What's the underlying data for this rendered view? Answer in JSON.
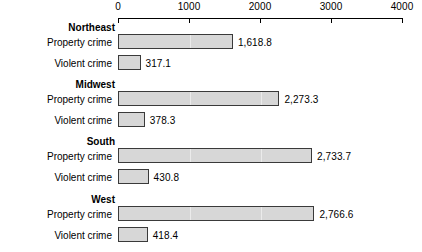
{
  "chart_data": {
    "type": "bar",
    "orientation": "horizontal",
    "title": "",
    "xlabel": "",
    "ylabel": "",
    "xlim": [
      0,
      4000
    ],
    "xticks": [
      0,
      1000,
      2000,
      3000,
      4000
    ],
    "xtick_labels": [
      "0",
      "1000",
      "2000",
      "3000",
      "4000"
    ],
    "grid": true,
    "legend": "none",
    "categories": [
      "Northeast",
      "Midwest",
      "South",
      "West"
    ],
    "series": [
      {
        "name": "Property crime",
        "values": [
          1618.8,
          2273.3,
          2733.7,
          2766.6
        ],
        "value_labels": [
          "1,618.8",
          "2,273.3",
          "2,733.7",
          "2,766.6"
        ]
      },
      {
        "name": "Violent crime",
        "values": [
          317.1,
          378.3,
          430.8,
          418.4
        ],
        "value_labels": [
          "317.1",
          "378.3",
          "430.8",
          "418.4"
        ]
      }
    ],
    "groups": [
      {
        "header": "Northeast",
        "rows": [
          {
            "label": "Property crime",
            "value": 1618.8,
            "value_label": "1,618.8"
          },
          {
            "label": "Violent crime",
            "value": 317.1,
            "value_label": "317.1"
          }
        ]
      },
      {
        "header": "Midwest",
        "rows": [
          {
            "label": "Property crime",
            "value": 2273.3,
            "value_label": "2,273.3"
          },
          {
            "label": "Violent crime",
            "value": 378.3,
            "value_label": "378.3"
          }
        ]
      },
      {
        "header": "South",
        "rows": [
          {
            "label": "Property crime",
            "value": 2733.7,
            "value_label": "2,733.7"
          },
          {
            "label": "Violent crime",
            "value": 430.8,
            "value_label": "430.8"
          }
        ]
      },
      {
        "header": "West",
        "rows": [
          {
            "label": "Property crime",
            "value": 2766.6,
            "value_label": "2,766.6"
          },
          {
            "label": "Violent crime",
            "value": 418.4,
            "value_label": "418.4"
          }
        ]
      }
    ],
    "colors": {
      "bar_fill": "#d7d7d7",
      "bar_stroke": "#3a3a3a",
      "axis": "#000000",
      "grid": "#ebebeb",
      "text": "#000000"
    }
  },
  "layout": {
    "plot_left_px": 118,
    "plot_right_px": 402,
    "group_tops_px": [
      22,
      79,
      136,
      194
    ],
    "header_height_px": 12,
    "row_height_px": 21,
    "bar_height_px": 15
  }
}
